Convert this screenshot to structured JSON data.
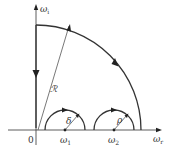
{
  "diagram": {
    "type": "contour-in-complex-frequency-plane",
    "axes": {
      "horizontal": {
        "label": "ω",
        "subscript": "r"
      },
      "vertical": {
        "label": "ω",
        "subscript": "i"
      },
      "origin_label": "0"
    },
    "large_arc": {
      "radius_label": "ℛ",
      "direction": "counterclockwise"
    },
    "indentations": [
      {
        "center_label": "ω",
        "center_subscript": "1",
        "radius_label": "δ"
      },
      {
        "center_label": "ω",
        "center_subscript": "2",
        "radius_label": "ρ"
      }
    ],
    "colors": {
      "stroke": "#333333",
      "background": "#ffffff"
    }
  }
}
